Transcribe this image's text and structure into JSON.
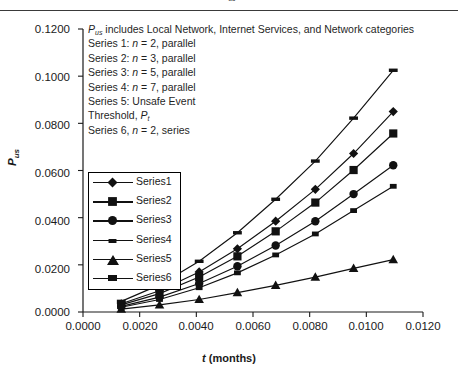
{
  "caption": {
    "text": "Figure: P    us  vs. t for operational failure",
    "visible_fragment": "P",
    "sub": "us"
  },
  "chart_data": {
    "type": "line",
    "title": "",
    "xlabel": "t (months)",
    "ylabel": "P",
    "ylabel_sub": "us",
    "xlim": [
      0.0,
      0.012
    ],
    "ylim": [
      0.0,
      0.12
    ],
    "xticks": [
      "0.0000",
      "0.0020",
      "0.0040",
      "0.0060",
      "0.0080",
      "0.0100",
      "0.0120"
    ],
    "yticks": [
      "0.0000",
      "0.0200",
      "0.0400",
      "0.0600",
      "0.0800",
      "0.1000",
      "0.1200"
    ],
    "xtick_values": [
      0.0,
      0.002,
      0.004,
      0.006,
      0.008,
      0.01,
      0.012
    ],
    "ytick_values": [
      0.0,
      0.02,
      0.04,
      0.06,
      0.08,
      0.1,
      0.12
    ],
    "grid": false,
    "legend_position": "inside-left",
    "x": [
      0.00135,
      0.0027,
      0.0041,
      0.00545,
      0.0068,
      0.0082,
      0.00955,
      0.01095
    ],
    "series": [
      {
        "name": "Series1",
        "marker": "diamond",
        "values": [
          0.0035,
          0.009,
          0.017,
          0.0268,
          0.0385,
          0.052,
          0.0672,
          0.085
        ]
      },
      {
        "name": "Series2",
        "marker": "square",
        "values": [
          0.003,
          0.0078,
          0.0148,
          0.0236,
          0.0342,
          0.0464,
          0.0602,
          0.0757
        ]
      },
      {
        "name": "Series3",
        "marker": "circle",
        "values": [
          0.0024,
          0.0063,
          0.0121,
          0.0194,
          0.0282,
          0.0385,
          0.05,
          0.0622
        ]
      },
      {
        "name": "Series4",
        "marker": "dash",
        "values": [
          0.0045,
          0.0115,
          0.0215,
          0.0336,
          0.0478,
          0.064,
          0.0822,
          0.1025
        ]
      },
      {
        "name": "Series5",
        "marker": "triangle",
        "values": [
          0.0012,
          0.003,
          0.0053,
          0.0082,
          0.0113,
          0.0148,
          0.0185,
          0.0222
        ]
      },
      {
        "name": "Series6",
        "marker": "small-square",
        "values": [
          0.002,
          0.0053,
          0.0103,
          0.0166,
          0.0242,
          0.0331,
          0.043,
          0.0533
        ]
      }
    ],
    "annotations": [
      "P_us includes Local Network, Internet Services, and Network categories",
      "Series 1: n = 2, parallel",
      "Series 2: n = 3, parallel",
      "Series 3: n = 5, parallel",
      "Series 4: n = 7, parallel",
      "Series 5: Unsafe Event",
      "Threshold, P_t",
      "Series 6, n = 2, series"
    ]
  },
  "annot": {
    "l1_a": "P",
    "l1_sub": "us",
    "l1_b": " includes Local Network, Internet Services, and Network categories",
    "l2_a": "Series 1: ",
    "l2_n": "n",
    "l2_b": " = 2, parallel",
    "l3_a": "Series 2: ",
    "l3_n": "n",
    "l3_b": " = 3, parallel",
    "l4_a": "Series 3: ",
    "l4_n": "n",
    "l4_b": " = 5, parallel",
    "l5_a": "Series 4: ",
    "l5_n": "n",
    "l5_b": " = 7, parallel",
    "l6": "Series 5: Unsafe Event",
    "l7_a": "Threshold, ",
    "l7_p": "P",
    "l7_sub": "t",
    "l8_a": "Series 6, ",
    "l8_n": "n",
    "l8_b": " = 2, series"
  },
  "legend": {
    "items": [
      {
        "label": "Series1"
      },
      {
        "label": "Series2"
      },
      {
        "label": "Series3"
      },
      {
        "label": "Series4"
      },
      {
        "label": "Series5"
      },
      {
        "label": "Series6"
      }
    ]
  },
  "axis_titles": {
    "y_main": "P",
    "y_sub": "us",
    "x_italic": "t",
    "x_rest": " (months)"
  },
  "colors": {
    "line": "#111111",
    "axis": "#1a1a1a",
    "text": "#1a1a1a"
  }
}
